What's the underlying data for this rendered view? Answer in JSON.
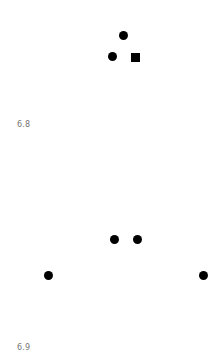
{
  "figures": [
    {
      "label": "6.8",
      "shapes": [
        {
          "type": "circle",
          "x": 123,
          "y": 35
        },
        {
          "type": "circle",
          "x": 112,
          "y": 56
        },
        {
          "type": "square",
          "x": 135,
          "y": 57
        }
      ]
    },
    {
      "label": "6.9",
      "shapes": [
        {
          "type": "circle",
          "x": 114,
          "y": 239
        },
        {
          "type": "circle",
          "x": 137,
          "y": 239
        },
        {
          "type": "circle",
          "x": 48,
          "y": 275
        },
        {
          "type": "circle",
          "x": 203,
          "y": 275
        }
      ]
    }
  ],
  "colors": {
    "shape": "#000000",
    "label": "#777777"
  }
}
